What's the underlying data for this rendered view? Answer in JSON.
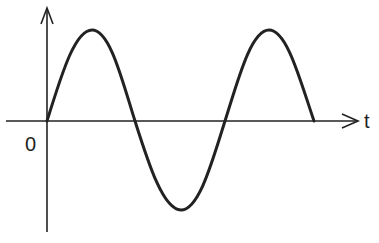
{
  "diagram": {
    "type": "sine-wave-graph",
    "axis_labels": {
      "horizontal": "t",
      "origin": "0"
    },
    "wave": {
      "cycles": 1.5,
      "description": "sine wave starting at origin going up, 1.5 periods, ending on axis",
      "stroke_color": "#222222"
    },
    "axis_color": "#222222"
  }
}
